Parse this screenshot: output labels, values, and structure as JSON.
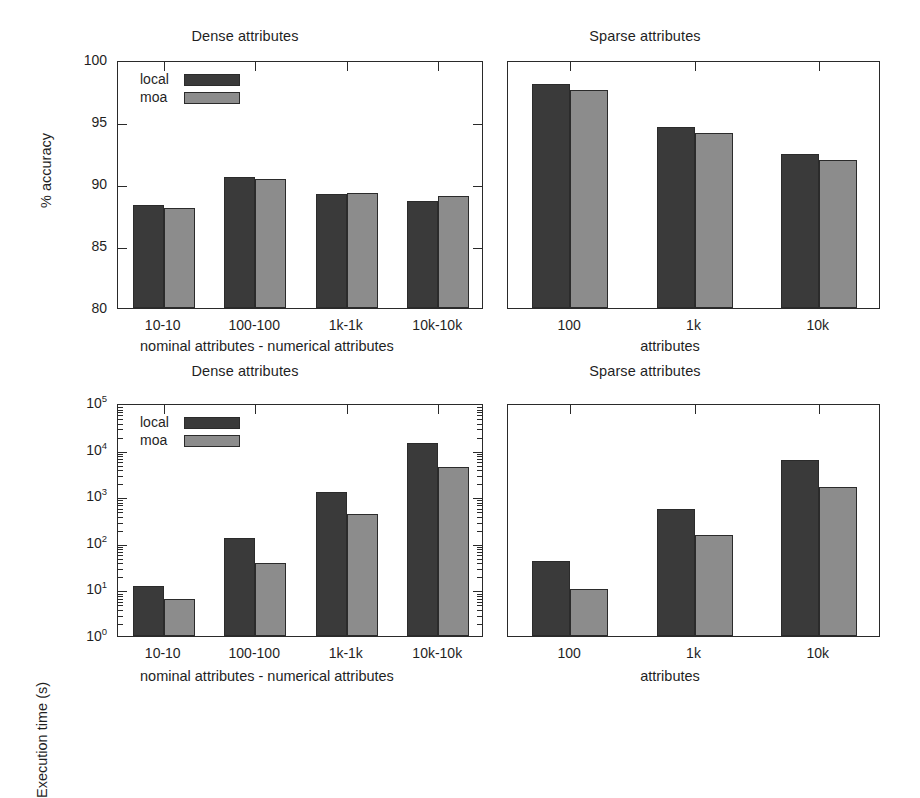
{
  "figure": {
    "background": "#ffffff",
    "series_colors": {
      "local": "#3a3a3a",
      "moa": "#8c8c8c"
    },
    "legend_labels": {
      "local": "local",
      "moa": "moa"
    }
  },
  "panels": {
    "top_left": {
      "title": "Dense attributes",
      "ylabel": "% accuracy",
      "xlabel": "nominal attributes - numerical attributes",
      "yticks": [
        "100",
        "95",
        "90",
        "85",
        "80"
      ],
      "xticks": [
        "10-10",
        "100-100",
        "1k-1k",
        "10k-10k"
      ]
    },
    "top_right": {
      "title": "Sparse attributes",
      "ylabel": "",
      "xlabel": "attributes",
      "yticks": [],
      "xticks": [
        "100",
        "1k",
        "10k"
      ]
    },
    "bottom_left": {
      "title": "Dense attributes",
      "ylabel": "Execution time (s)",
      "xlabel": "nominal attributes - numerical attributes",
      "yticks": [
        "10",
        "10",
        "10",
        "10",
        "10",
        "10"
      ],
      "ytick_exponents": [
        "5",
        "4",
        "3",
        "2",
        "1",
        "0"
      ],
      "xticks": [
        "10-10",
        "100-100",
        "1k-1k",
        "10k-10k"
      ]
    },
    "bottom_right": {
      "title": "Sparse attributes",
      "ylabel": "",
      "xlabel": "attributes",
      "yticks": [],
      "xticks": [
        "100",
        "1k",
        "10k"
      ]
    }
  },
  "chart_data": [
    {
      "id": "top_left",
      "type": "bar",
      "title": "Dense attributes",
      "xlabel": "nominal attributes - numerical attributes",
      "ylabel": "% accuracy",
      "categories": [
        "10-10",
        "100-100",
        "1k-1k",
        "10k-10k"
      ],
      "series": [
        {
          "name": "local",
          "values": [
            88.3,
            90.6,
            89.2,
            88.6
          ]
        },
        {
          "name": "moa",
          "values": [
            88.1,
            90.4,
            89.25,
            89.0
          ]
        }
      ],
      "ylim": [
        80,
        100
      ],
      "ytick_values": [
        80,
        85,
        90,
        95,
        100
      ],
      "yscale": "linear",
      "grid": false,
      "legend": "inside-top-left"
    },
    {
      "id": "top_right",
      "type": "bar",
      "title": "Sparse attributes",
      "xlabel": "attributes",
      "ylabel": "",
      "categories": [
        "100",
        "1k",
        "10k"
      ],
      "series": [
        {
          "name": "local",
          "values": [
            98.1,
            94.6,
            92.4
          ]
        },
        {
          "name": "moa",
          "values": [
            97.6,
            94.1,
            91.9
          ]
        }
      ],
      "ylim": [
        80,
        100
      ],
      "ytick_values": [
        80,
        85,
        90,
        95,
        100
      ],
      "yscale": "linear",
      "grid": false,
      "legend": "none"
    },
    {
      "id": "bottom_left",
      "type": "bar",
      "title": "Dense attributes",
      "xlabel": "nominal attributes - numerical attributes",
      "ylabel": "Execution time (s)",
      "categories": [
        "10-10",
        "100-100",
        "1k-1k",
        "10k-10k"
      ],
      "series": [
        {
          "name": "local",
          "values": [
            12,
            125,
            1250,
            14000
          ]
        },
        {
          "name": "moa",
          "values": [
            6.2,
            37,
            420,
            4300
          ]
        }
      ],
      "ylim": [
        1,
        100000
      ],
      "ytick_values": [
        1,
        10,
        100,
        1000,
        10000,
        100000
      ],
      "ytick_labels": [
        "10^0",
        "10^1",
        "10^2",
        "10^3",
        "10^4",
        "10^5"
      ],
      "yscale": "log",
      "grid": false,
      "legend": "inside-top-left"
    },
    {
      "id": "bottom_right",
      "type": "bar",
      "title": "Sparse attributes",
      "xlabel": "attributes",
      "ylabel": "",
      "categories": [
        "100",
        "1k",
        "10k"
      ],
      "series": [
        {
          "name": "local",
          "values": [
            40,
            540,
            6000
          ]
        },
        {
          "name": "moa",
          "values": [
            10,
            145,
            1600
          ]
        }
      ],
      "ylim": [
        1,
        100000
      ],
      "ytick_values": [
        1,
        10,
        100,
        1000,
        10000,
        100000
      ],
      "yscale": "log",
      "grid": false,
      "legend": "none"
    }
  ]
}
